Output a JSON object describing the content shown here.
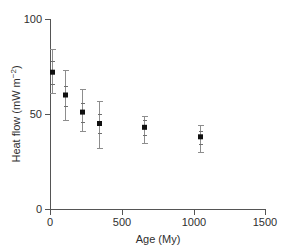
{
  "chart_data": {
    "type": "scatter",
    "title": "",
    "xlabel": "Age (My)",
    "ylabel": "Heat flow (mW m⁻²)",
    "ylabel_main": "Heat flow (mW  m",
    "ylabel_exp": "−2",
    "ylabel_close": ")",
    "xlim": [
      0,
      1500
    ],
    "ylim": [
      0,
      100
    ],
    "xticks": [
      0,
      500,
      1000,
      1500
    ],
    "yticks": [
      0,
      50,
      100
    ],
    "xtick_labels": [
      "0",
      "500",
      "1000",
      "1500"
    ],
    "ytick_labels": [
      "0",
      "50",
      "100"
    ],
    "grid": false,
    "legend": false,
    "x": [
      15,
      105,
      225,
      340,
      655,
      1045
    ],
    "y": [
      72,
      60,
      51,
      45,
      43,
      38
    ],
    "yerr_low": [
      61,
      47,
      41,
      32,
      35,
      30
    ],
    "yerr_high": [
      84,
      73,
      63,
      57,
      49,
      44
    ],
    "yerr_inner_low": [
      66,
      54,
      46,
      40,
      39,
      34
    ],
    "yerr_inner_high": [
      78,
      65,
      56,
      50,
      47,
      41
    ],
    "points": [
      {
        "age": 15,
        "heat_flow": 72,
        "err_low": 61,
        "err_high": 84
      },
      {
        "age": 105,
        "heat_flow": 60,
        "err_low": 47,
        "err_high": 73
      },
      {
        "age": 225,
        "heat_flow": 51,
        "err_low": 41,
        "err_high": 63
      },
      {
        "age": 340,
        "heat_flow": 45,
        "err_low": 32,
        "err_high": 57
      },
      {
        "age": 655,
        "heat_flow": 43,
        "err_low": 35,
        "err_high": 49
      },
      {
        "age": 1045,
        "heat_flow": 38,
        "err_low": 30,
        "err_high": 44
      }
    ]
  },
  "colors": {
    "marker": "#101010",
    "errorbar": "#8d8d8d",
    "axis": "#555555",
    "text": "#2f2f2f",
    "background": "#ffffff"
  }
}
